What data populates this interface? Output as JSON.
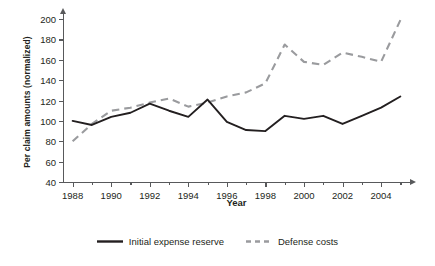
{
  "chart_data": {
    "type": "line",
    "title": "",
    "xlabel": "Year",
    "ylabel": "Per claim amounts (normalized)",
    "xlim": [
      1987.5,
      2005.5
    ],
    "ylim": [
      40,
      205
    ],
    "grid": false,
    "legend_position": "bottom-center",
    "x": [
      1988,
      1989,
      1990,
      1991,
      1992,
      1993,
      1994,
      1995,
      1996,
      1997,
      1998,
      1999,
      2000,
      2001,
      2002,
      2003,
      2004,
      2005
    ],
    "xticks_major": [
      1988,
      1990,
      1992,
      1994,
      1996,
      1998,
      2000,
      2002,
      2004
    ],
    "xticklabels": [
      "1988",
      "1990",
      "1992",
      "1994",
      "1996",
      "1998",
      "2000",
      "2002",
      "2004"
    ],
    "xticks_minor": [
      1989,
      1991,
      1993,
      1995,
      1997,
      1999,
      2001,
      2003,
      2005
    ],
    "yticks": [
      40,
      60,
      80,
      100,
      120,
      140,
      160,
      180,
      200
    ],
    "yticklabels": [
      "40",
      "60",
      "80",
      "100",
      "120",
      "140",
      "160",
      "180",
      "200"
    ],
    "series": [
      {
        "name": "Initial expense reserve",
        "color": "#231f20",
        "style": "solid",
        "values": [
          100,
          96,
          104,
          108,
          117,
          110,
          104,
          121,
          99,
          91,
          90,
          105,
          102,
          105,
          97,
          105,
          113,
          124
        ]
      },
      {
        "name": "Defense costs",
        "color": "#9a9b9e",
        "style": "dashed",
        "values": [
          80,
          97,
          110,
          113,
          118,
          122,
          114,
          118,
          124,
          128,
          137,
          175,
          158,
          155,
          167,
          163,
          158,
          199
        ]
      }
    ]
  },
  "legend": {
    "items": [
      {
        "label": "Initial expense reserve",
        "color": "#231f20",
        "style": "solid"
      },
      {
        "label": "Defense costs",
        "color": "#9a9b9e",
        "style": "dashed"
      }
    ]
  }
}
